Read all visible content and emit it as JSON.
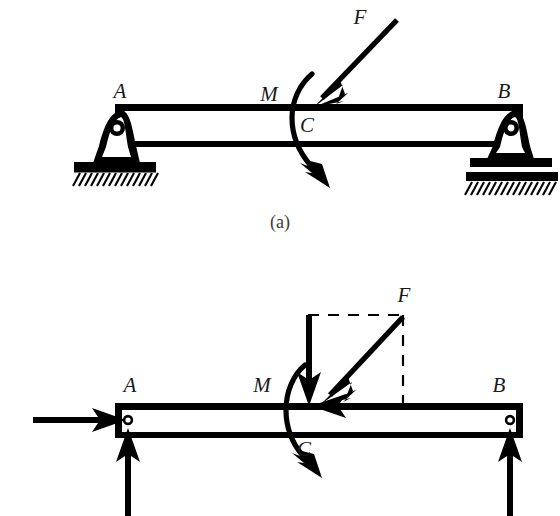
{
  "figure": {
    "title_visible": false,
    "type": "engineering-free-body-diagram",
    "colors": {
      "ink": "#000000",
      "label": "#1a1a1a",
      "paper": "#ffffff"
    },
    "subfigures": [
      {
        "id": "a",
        "caption": "(a)",
        "description": "simply supported beam with applied force F and couple M at C"
      },
      {
        "id": "b",
        "caption": "",
        "description": "free body diagram with reactions at A and B and F resolved into components"
      }
    ]
  },
  "panel_a": {
    "caption": "(a)",
    "labels": {
      "support_left": "A",
      "support_right": "B",
      "force": "F",
      "moment": "M",
      "point": "C"
    },
    "supports": {
      "left": {
        "kind": "pin-support",
        "name": "A",
        "ground": "hatched"
      },
      "right": {
        "kind": "roller-support",
        "name": "B",
        "ground": "hatched"
      }
    },
    "loads": [
      {
        "symbol": "F",
        "kind": "concentrated-force",
        "direction": "down-left",
        "angle_deg": 48,
        "applied_at": "C"
      },
      {
        "symbol": "M",
        "kind": "couple-moment",
        "sense": "clockwise",
        "applied_at": "C"
      }
    ]
  },
  "panel_b": {
    "caption": "",
    "labels": {
      "support_left": "A",
      "support_right": "B",
      "force": "F",
      "moment": "M",
      "point": "C"
    },
    "reactions": [
      {
        "at": "A",
        "component": "horizontal",
        "direction": "right"
      },
      {
        "at": "A",
        "component": "vertical",
        "direction": "up"
      },
      {
        "at": "B",
        "component": "vertical",
        "direction": "up"
      }
    ],
    "loads": [
      {
        "symbol": "F",
        "kind": "concentrated-force",
        "direction": "down-left",
        "angle_deg": 48,
        "applied_at": "C"
      },
      {
        "symbol": "",
        "kind": "force-component-vertical",
        "direction": "down",
        "applied_at": "C"
      },
      {
        "symbol": "",
        "kind": "force-component-horizontal",
        "direction": "left",
        "applied_at": "C"
      },
      {
        "symbol": "M",
        "kind": "couple-moment",
        "sense": "clockwise",
        "applied_at": "C"
      }
    ],
    "construction": {
      "kind": "dashed-rectangle",
      "purpose": "force-resolution-parallelogram"
    },
    "pins": [
      {
        "at": "A",
        "kind": "hinge-dot"
      },
      {
        "at": "B",
        "kind": "hinge-dot"
      }
    ]
  }
}
